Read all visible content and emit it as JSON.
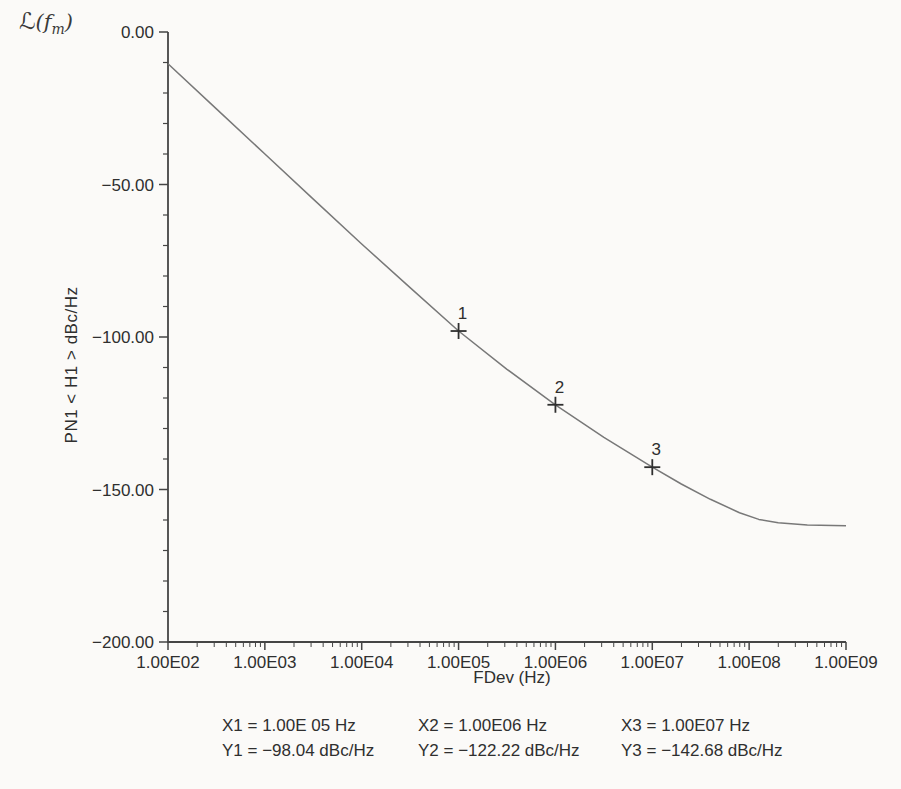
{
  "figure_title": {
    "script_l": "ℒ",
    "open": "(",
    "f_italic": "f",
    "sub": "m",
    "close": ")"
  },
  "chart_data": {
    "type": "line",
    "xlabel": "FDev (Hz)",
    "ylabel": "PN1 < H1 > dBc/Hz",
    "x_scale": "log",
    "x_range_log10": [
      2,
      9
    ],
    "ylim": [
      -200,
      0
    ],
    "grid": "off",
    "axis_color": "#454545",
    "line_color": "#787878",
    "text_color": "#2f2f2f",
    "x_ticks": [
      {
        "label": "1.00E02",
        "log10": 2
      },
      {
        "label": "1.00E03",
        "log10": 3
      },
      {
        "label": "1.00E04",
        "log10": 4
      },
      {
        "label": "1.00E05",
        "log10": 5
      },
      {
        "label": "1.00E06",
        "log10": 6
      },
      {
        "label": "1.00E07",
        "log10": 7
      },
      {
        "label": "1.00E08",
        "log10": 8
      },
      {
        "label": "1.00E09",
        "log10": 9
      }
    ],
    "y_ticks": [
      {
        "label": "0.00",
        "value": 0
      },
      {
        "label": "−50.00",
        "value": -50
      },
      {
        "label": "−100.00",
        "value": -100
      },
      {
        "label": "−150.00",
        "value": -150
      },
      {
        "label": "−200.00",
        "value": -200
      }
    ],
    "y_minor_step": 10,
    "curve_points": [
      [
        2.0,
        -10.4
      ],
      [
        2.5,
        -25.2
      ],
      [
        3.0,
        -40.0
      ],
      [
        3.5,
        -54.8
      ],
      [
        4.0,
        -69.5
      ],
      [
        4.5,
        -83.8
      ],
      [
        5.0,
        -98.04
      ],
      [
        5.5,
        -110.6
      ],
      [
        6.0,
        -122.22
      ],
      [
        6.5,
        -132.9
      ],
      [
        7.0,
        -142.68
      ],
      [
        7.3,
        -148.2
      ],
      [
        7.6,
        -153.2
      ],
      [
        7.9,
        -157.6
      ],
      [
        8.1,
        -159.8
      ],
      [
        8.3,
        -160.9
      ],
      [
        8.6,
        -161.6
      ],
      [
        9.0,
        -161.9
      ]
    ],
    "markers": [
      {
        "label": "1",
        "log10_x": 5,
        "y": -98.04
      },
      {
        "label": "2",
        "log10_x": 6,
        "y": -122.22
      },
      {
        "label": "3",
        "log10_x": 7,
        "y": -142.68
      }
    ]
  },
  "readouts": {
    "x1": "X1 = 1.00E 05 Hz",
    "x2": "X2 = 1.00E06 Hz",
    "x3": "X3 = 1.00E07 Hz",
    "y1": "Y1 = −98.04 dBc/Hz",
    "y2": "Y2 = −122.22 dBc/Hz",
    "y3": "Y3 = −142.68 dBc/Hz"
  }
}
